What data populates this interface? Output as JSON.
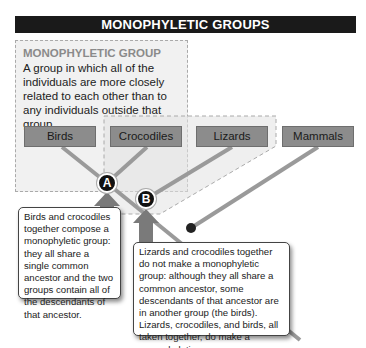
{
  "title": "MONOPHYLETIC GROUPS",
  "definition": {
    "heading": "MONOPHYLETIC GROUP",
    "text": "A group in which all of the individuals are more closely related to each other than to any individuals outside that group"
  },
  "taxa": [
    {
      "label": "Birds"
    },
    {
      "label": "Crocodiles"
    },
    {
      "label": "Lizards"
    },
    {
      "label": "Mammals"
    }
  ],
  "nodes": [
    {
      "label": "A"
    },
    {
      "label": "B"
    }
  ],
  "callouts": [
    {
      "text": "Birds and crocodiles together compose a monophyletic group: they all share a single common ancestor and the two groups contain all of the descendants of that ancestor."
    },
    {
      "text": "Lizards and crocodiles together do not make a monophyletic group: although they all share a common ancestor, some descendants of that ancestor are in another group (the birds). Lizards, crocodiles, and birds, all taken together, do make a monophyletic group."
    }
  ],
  "colors": {
    "title_bg": "#1a1a1a",
    "taxon_box": "#8c8c8c",
    "branch": "#9a9a9a",
    "arrow": "#7a7a7a",
    "node": "#111111"
  }
}
